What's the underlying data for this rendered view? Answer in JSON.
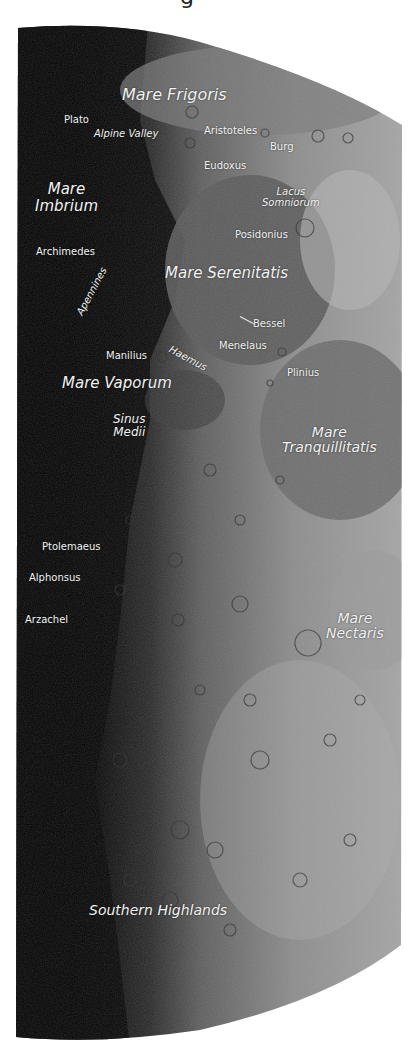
{
  "title_fragment": "g",
  "image": {
    "subject": "Half Moon (first quarter) with labeled lunar features",
    "colors": {
      "background": "#ffffff",
      "shadow": "#050505",
      "mare": "#6f6f6f",
      "highlands": "#a8a8a8",
      "label": "#f2f2f2"
    }
  },
  "labels": {
    "mare_frigoris": "Mare Frigoris",
    "plato": "Plato",
    "alpine_valley": "Alpine Valley",
    "aristoteles": "Aristoteles",
    "burg": "Burg",
    "eudoxus": "Eudoxus",
    "mare_imbrium_1": "Mare",
    "mare_imbrium_2": "Imbrium",
    "lacus_somniorum_1": "Lacus",
    "lacus_somniorum_2": "Somniorum",
    "posidonius": "Posidonius",
    "archimedes": "Archimedes",
    "mare_serenitatis": "Mare Serenitatis",
    "apennines": "Apennines",
    "bessel": "Bessel",
    "haemus": "Haemus",
    "menelaus": "Menelaus",
    "manilius": "Manilius",
    "plinius": "Plinius",
    "mare_vaporum": "Mare Vaporum",
    "sinus_medii_1": "Sinus",
    "sinus_medii_2": "Medii",
    "mare_tranquillitatis_1": "Mare",
    "mare_tranquillitatis_2": "Tranquillitatis",
    "ptolemaeus": "Ptolemaeus",
    "alphonsus": "Alphonsus",
    "arzachel": "Arzachel",
    "mare_nectaris_1": "Mare",
    "mare_nectaris_2": "Nectaris",
    "southern_highlands": "Southern Highlands"
  }
}
